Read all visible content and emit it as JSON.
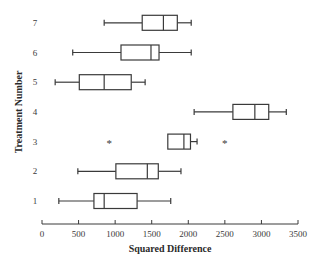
{
  "chart_data": {
    "type": "boxplot",
    "orientation": "horizontal",
    "title": "",
    "xlabel": "Squared Difference",
    "ylabel": "Treatment Number",
    "xlim": [
      0,
      3500
    ],
    "xticks": [
      0,
      500,
      1000,
      1500,
      2000,
      2500,
      3000,
      3500
    ],
    "categories": [
      "1",
      "2",
      "3",
      "4",
      "5",
      "6",
      "7"
    ],
    "grid": false,
    "legend": null,
    "series": [
      {
        "name": "1",
        "whisker_low": 230,
        "q1": 710,
        "median": 850,
        "q3": 1300,
        "whisker_high": 1760,
        "outliers": []
      },
      {
        "name": "2",
        "whisker_low": 490,
        "q1": 1010,
        "median": 1440,
        "q3": 1590,
        "whisker_high": 1900,
        "outliers": []
      },
      {
        "name": "3",
        "whisker_low": 1720,
        "q1": 1720,
        "median": 1940,
        "q3": 2030,
        "whisker_high": 2120,
        "outliers": [
          920,
          2500
        ]
      },
      {
        "name": "4",
        "whisker_low": 2080,
        "q1": 2610,
        "median": 2910,
        "q3": 3100,
        "whisker_high": 3340,
        "outliers": []
      },
      {
        "name": "5",
        "whisker_low": 180,
        "q1": 510,
        "median": 850,
        "q3": 1220,
        "whisker_high": 1410,
        "outliers": []
      },
      {
        "name": "6",
        "whisker_low": 420,
        "q1": 1080,
        "median": 1490,
        "q3": 1600,
        "whisker_high": 2040,
        "outliers": []
      },
      {
        "name": "7",
        "whisker_low": 850,
        "q1": 1370,
        "median": 1660,
        "q3": 1850,
        "whisker_high": 2040,
        "outliers": []
      }
    ]
  },
  "style": {
    "line_color": "#3a3a3a",
    "box_fill": "#ffffff",
    "background": "#ffffff"
  }
}
